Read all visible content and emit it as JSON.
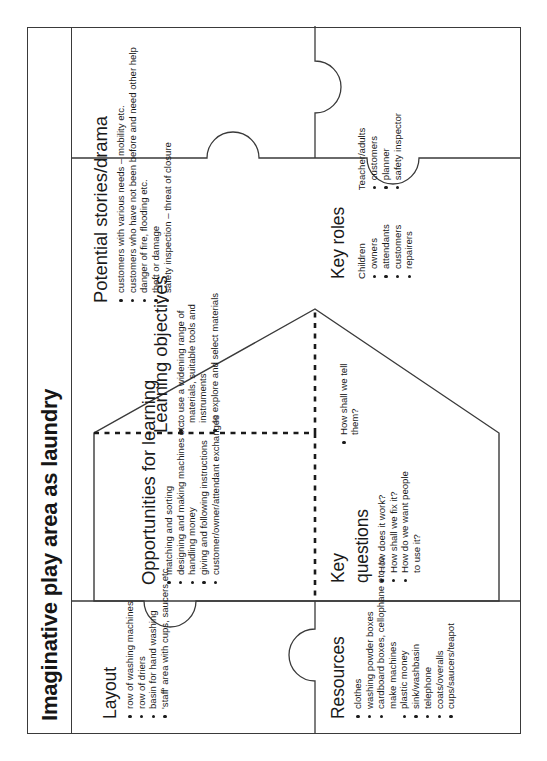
{
  "title": "Imaginative play area as laundry",
  "pieces": {
    "resources": {
      "heading": "Resources",
      "items": [
        "clothes",
        "washing powder boxes",
        "cardboard boxes, cellophane etc. to make machines",
        "plastic money",
        "sink/washbasin",
        "telephone",
        "coats/overalls",
        "cups/saucers/teapot"
      ]
    },
    "layout": {
      "heading": "Layout",
      "items": [
        "row of washing machines",
        "row of driers",
        "basin for hand washing",
        "'staff' area with cups, saucers etc."
      ]
    },
    "key_roles": {
      "heading": "Key roles",
      "groups": [
        {
          "label": "Children",
          "items": [
            "owners",
            "attendants",
            "customers",
            "repairers"
          ]
        },
        {
          "label": "Teacher/adults",
          "items": [
            "customers",
            "planner",
            "safety inspector"
          ]
        }
      ]
    },
    "potential_stories": {
      "heading": "Potential stories/drama",
      "items": [
        "customers with various needs – mobility etc.",
        "customers who have not been before and need other help",
        "danger of fire, flooding etc.",
        "theft or damage",
        "safety inspection – threat of closure"
      ]
    }
  },
  "centre": {
    "opportunities": {
      "heading": "Opportunities for learning",
      "items": [
        "matching and sorting",
        "designing and making machines etc.",
        "handling money",
        "giving and following instructions",
        "customer/owner/attendant exchanges"
      ]
    },
    "key_questions": {
      "heading_line1": "Key",
      "heading_line2": "questions",
      "items": [
        "How does it work?",
        "How shall we fix it?",
        "How do we want people to use it?",
        "How shall we tell them?"
      ],
      "items_left": [
        "How does it work?",
        "How shall we fix it?",
        "How do we want people to use it?"
      ],
      "items_right": [
        "How shall we tell them?"
      ]
    },
    "learning_objectives": {
      "heading": "Learning objectives",
      "items": [
        "to use a widening range of materials, suitable tools and instruments",
        "to explore and select materials"
      ]
    }
  },
  "colors": {
    "ink": "#1a1a1a",
    "rule": "#3a3a3a",
    "paper": "#ffffff"
  }
}
